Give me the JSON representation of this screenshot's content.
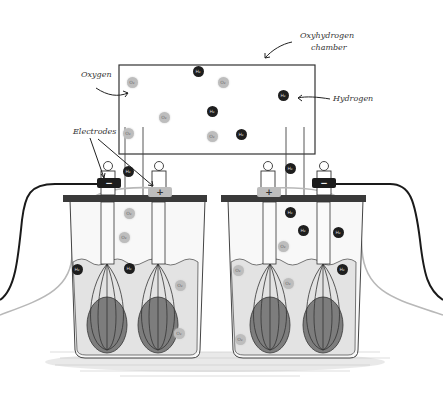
{
  "diagram": {
    "type": "electrolysis-illustration",
    "labels": {
      "chamber": "Oxyhydrogen\nchamber",
      "chamber_line1": "Oxyhydrogen",
      "chamber_line2": "chamber",
      "oxygen": "Oxygen",
      "hydrogen": "Hydrogen",
      "electrodes": "Electrodes"
    },
    "molecule_text": {
      "hydrogen": "H₂",
      "oxygen": "O₂"
    },
    "terminals": {
      "negative": "−",
      "positive": "+"
    },
    "colors": {
      "hydrogen": "#1e1e1e",
      "oxygen": "#bdbdbd",
      "water": "#e3e3e3",
      "lid": "#3a3a3a",
      "wire_dark": "#1a1a1a",
      "wire_light": "#b8b8b8",
      "outline": "#333333"
    },
    "chamber_molecules": [
      {
        "kind": "o",
        "x": 132,
        "y": 82
      },
      {
        "kind": "h",
        "x": 198,
        "y": 71
      },
      {
        "kind": "o",
        "x": 223,
        "y": 82
      },
      {
        "kind": "h",
        "x": 283,
        "y": 95
      },
      {
        "kind": "o",
        "x": 164,
        "y": 117
      },
      {
        "kind": "h",
        "x": 212,
        "y": 111
      },
      {
        "kind": "o",
        "x": 128,
        "y": 133
      },
      {
        "kind": "o",
        "x": 212,
        "y": 136
      },
      {
        "kind": "h",
        "x": 241,
        "y": 134
      }
    ],
    "tank_molecules": [
      {
        "kind": "h",
        "x": 128,
        "y": 171
      },
      {
        "kind": "h",
        "x": 290,
        "y": 168
      },
      {
        "kind": "o",
        "x": 129,
        "y": 213
      },
      {
        "kind": "o",
        "x": 124,
        "y": 237
      },
      {
        "kind": "h",
        "x": 77,
        "y": 269
      },
      {
        "kind": "h",
        "x": 129,
        "y": 268
      },
      {
        "kind": "o",
        "x": 180,
        "y": 285
      },
      {
        "kind": "o",
        "x": 179,
        "y": 333
      },
      {
        "kind": "h",
        "x": 290,
        "y": 212
      },
      {
        "kind": "h",
        "x": 303,
        "y": 230
      },
      {
        "kind": "h",
        "x": 338,
        "y": 232
      },
      {
        "kind": "o",
        "x": 283,
        "y": 246
      },
      {
        "kind": "o",
        "x": 238,
        "y": 270
      },
      {
        "kind": "o",
        "x": 288,
        "y": 283
      },
      {
        "kind": "h",
        "x": 342,
        "y": 269
      },
      {
        "kind": "o",
        "x": 240,
        "y": 339
      }
    ]
  }
}
